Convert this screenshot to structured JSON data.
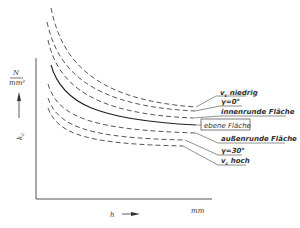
{
  "diagram": {
    "y_axis": {
      "unit_numerator": "N",
      "unit_denominator": "mm²",
      "label": "k",
      "label_sub": "c"
    },
    "x_axis": {
      "label": "h",
      "unit": "mm"
    },
    "curves": [
      {
        "id": "vc-niedrig",
        "label": "vc niedrig",
        "style": "dashed"
      },
      {
        "id": "gamma-0",
        "label": "γ=0°",
        "style": "dashed"
      },
      {
        "id": "innenrunde",
        "label": "innenrunde Fläche",
        "style": "dashed"
      },
      {
        "id": "ebene",
        "label": "ebene Fläche",
        "style": "solid",
        "boxed": true
      },
      {
        "id": "aussenrunde",
        "label": "außenrunde Fläche",
        "style": "dashed"
      },
      {
        "id": "gamma-30",
        "label": "γ=30°",
        "style": "dashed"
      },
      {
        "id": "vc-hoch",
        "label": "vc hoch",
        "style": "dashed"
      }
    ],
    "labels": {
      "vc_niedrig_v": "v",
      "vc_niedrig_sub": "c",
      "vc_niedrig_rest": " niedrig",
      "gamma0": "γ=0°",
      "innenrunde": "innenrunde Fläche",
      "ebene": "ebene Fläche",
      "aussenrunde": "außenrunde Fläche",
      "gamma30": "γ=30°",
      "vc_hoch_v": "v",
      "vc_hoch_sub": "c",
      "vc_hoch_rest": " hoch"
    }
  }
}
